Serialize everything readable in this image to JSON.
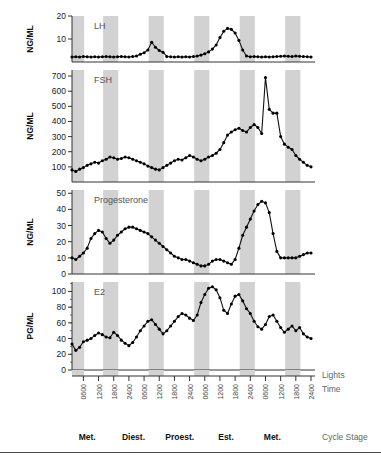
{
  "figure": {
    "panels": [
      {
        "key": "lh",
        "label": "LH",
        "unit": "NG/ML",
        "ylim": [
          0,
          20
        ],
        "yticks": [
          10,
          20
        ]
      },
      {
        "key": "fsh",
        "label": "FSH",
        "unit": "NG/ML",
        "ylim": [
          0,
          740
        ],
        "yticks": [
          100,
          200,
          300,
          400,
          500,
          600,
          700
        ]
      },
      {
        "key": "prog",
        "label": "Progesterone",
        "unit": "NG/ML",
        "ylim": [
          0,
          52
        ],
        "yticks": [
          0,
          10,
          20,
          30,
          40,
          50
        ]
      },
      {
        "key": "e2",
        "label": "E2",
        "unit": "PG/ML",
        "ylim": [
          0,
          112
        ],
        "yticks": [
          0,
          20,
          40,
          60,
          80,
          100
        ]
      }
    ],
    "side_labels": {
      "lights": "Lights",
      "time": "Time",
      "cycle_stage": "Cycle Stage"
    },
    "time_ticks": [
      "0600",
      "1200",
      "1800",
      "2400",
      "0600",
      "1200",
      "1800",
      "2400",
      "0600",
      "1200",
      "1800",
      "2400",
      "0600",
      "1200",
      "1800",
      "2400"
    ],
    "cycle_stages": [
      "Met.",
      "Diest.",
      "Proest.",
      "Est.",
      "Met."
    ],
    "dark_bands_note": "shaded vertical bands mark lights-off periods",
    "colors": {
      "band": "#d2d2d2",
      "line": "#111111",
      "marker": "#000000",
      "axis": "#333333"
    }
  },
  "chart_data": {
    "type": "line",
    "title": "",
    "xlabel": "Time",
    "x": [
      0,
      1,
      2,
      3,
      4,
      5,
      6,
      7,
      8,
      9,
      10,
      11,
      12,
      13,
      14,
      15,
      16,
      17,
      18,
      19,
      20,
      21,
      22,
      23,
      24,
      25,
      26,
      27,
      28,
      29,
      30,
      31,
      32,
      33,
      34,
      35,
      36,
      37,
      38,
      39,
      40,
      41,
      42,
      43,
      44,
      45,
      46,
      47,
      48,
      49,
      50,
      51,
      52,
      53,
      54,
      55,
      56,
      57,
      58,
      59,
      60,
      61,
      62,
      63
    ],
    "xtick_labels": [
      "0600",
      "1200",
      "1800",
      "2400",
      "0600",
      "1200",
      "1800",
      "2400",
      "0600",
      "1200",
      "1800",
      "2400",
      "0600",
      "1200",
      "1800",
      "2400"
    ],
    "shaded_spans": [
      [
        0,
        3.2
      ],
      [
        8.2,
        12.2
      ],
      [
        20.2,
        24.2
      ],
      [
        32.2,
        36.2
      ],
      [
        44.2,
        48.2
      ],
      [
        56.2,
        60.2
      ]
    ],
    "series": [
      {
        "name": "LH",
        "ylabel": "NG/ML",
        "unit": "NG/ML",
        "ylim": [
          0,
          20
        ],
        "yticks": [
          10,
          20
        ],
        "values": [
          2.2,
          2.3,
          2.2,
          2.4,
          2.3,
          2.2,
          2.3,
          2.2,
          2.3,
          2.4,
          2.3,
          2.2,
          2.3,
          2.4,
          2.3,
          2.2,
          2.4,
          2.6,
          3.4,
          4.0,
          5.2,
          8.6,
          6.4,
          5.0,
          4.2,
          2.4,
          2.3,
          2.2,
          2.3,
          2.2,
          2.3,
          2.2,
          2.4,
          2.6,
          3.0,
          3.6,
          4.4,
          5.6,
          7.4,
          10.6,
          13.4,
          14.6,
          14.2,
          12.6,
          9.4,
          5.2,
          2.6,
          2.3,
          2.4,
          2.3,
          2.2,
          2.3,
          2.2,
          2.3,
          2.4,
          2.5,
          2.6,
          2.5,
          2.4,
          2.6,
          2.5,
          2.4,
          2.3,
          2.2
        ]
      },
      {
        "name": "FSH",
        "ylabel": "NG/ML",
        "unit": "NG/ML",
        "ylim": [
          0,
          740
        ],
        "yticks": [
          100,
          200,
          300,
          400,
          500,
          600,
          700
        ],
        "values": [
          80,
          70,
          85,
          95,
          110,
          120,
          130,
          125,
          140,
          150,
          165,
          160,
          150,
          155,
          165,
          160,
          150,
          140,
          130,
          120,
          105,
          95,
          85,
          80,
          95,
          110,
          125,
          140,
          150,
          145,
          160,
          175,
          165,
          150,
          140,
          150,
          165,
          175,
          190,
          215,
          260,
          310,
          330,
          345,
          355,
          340,
          330,
          360,
          380,
          360,
          320,
          690,
          480,
          455,
          455,
          300,
          250,
          230,
          215,
          175,
          150,
          130,
          110,
          100
        ]
      },
      {
        "name": "Progesterone",
        "ylabel": "NG/ML",
        "unit": "NG/ML",
        "ylim": [
          0,
          52
        ],
        "yticks": [
          0,
          10,
          20,
          30,
          40,
          50
        ],
        "values": [
          10,
          9,
          11,
          13,
          16,
          22,
          25,
          27,
          26,
          22,
          19,
          21,
          24,
          26,
          28,
          29,
          29,
          28,
          27,
          26,
          25,
          23,
          21,
          19,
          17,
          15,
          13,
          11,
          10,
          9,
          9,
          8,
          7,
          6,
          5,
          5,
          6,
          8,
          9,
          9,
          8,
          7,
          6,
          9,
          16,
          24,
          29,
          34,
          39,
          43,
          45,
          44,
          38,
          25,
          14,
          10,
          10,
          10,
          10,
          10,
          11,
          12,
          13,
          13
        ]
      },
      {
        "name": "E2",
        "ylabel": "PG/ML",
        "unit": "PG/ML",
        "ylim": [
          0,
          112
        ],
        "yticks": [
          0,
          20,
          40,
          60,
          80,
          100
        ],
        "values": [
          33,
          25,
          29,
          36,
          38,
          40,
          44,
          47,
          45,
          42,
          41,
          48,
          44,
          38,
          34,
          31,
          35,
          42,
          50,
          56,
          62,
          64,
          58,
          52,
          46,
          50,
          56,
          62,
          68,
          72,
          70,
          66,
          63,
          70,
          86,
          96,
          104,
          106,
          102,
          92,
          76,
          72,
          84,
          94,
          96,
          88,
          78,
          72,
          62,
          55,
          52,
          58,
          68,
          70,
          62,
          54,
          48,
          52,
          56,
          50,
          54,
          46,
          42,
          40
        ]
      }
    ]
  }
}
